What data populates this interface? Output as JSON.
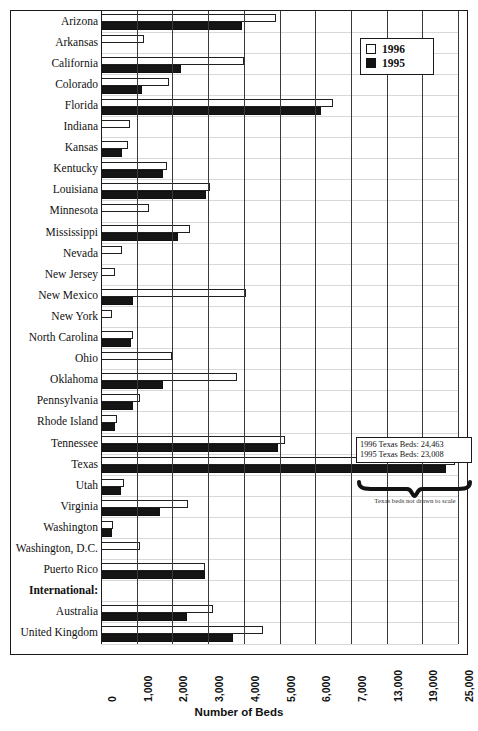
{
  "chart_data": {
    "type": "bar",
    "orientation": "horizontal",
    "title": "",
    "xlabel": "Number of Beds",
    "ylabel": "",
    "grid": true,
    "legend_position": "top-right",
    "axis_break_note": "Axis is broken after 7,000; remaining ticks are 13,000 / 19,000 / 25,000",
    "xticks": [
      "0",
      "1,000",
      "2,000",
      "3,000",
      "4,000",
      "5,000",
      "6,000",
      "7,000",
      "13,000",
      "19,000",
      "25,000"
    ],
    "xtick_values": [
      0,
      1000,
      2000,
      3000,
      4000,
      5000,
      6000,
      7000,
      13000,
      19000,
      25000
    ],
    "categories": [
      "Arizona",
      "Arkansas",
      "California",
      "Colorado",
      "Florida",
      "Indiana",
      "Kansas",
      "Kentucky",
      "Louisiana",
      "Minnesota",
      "Mississippi",
      "Nevada",
      "New Jersey",
      "New Mexico",
      "New York",
      "North Carolina",
      "Ohio",
      "Oklahoma",
      "Pennsylvania",
      "Rhode Island",
      "Tennessee",
      "Texas",
      "Utah",
      "Virginia",
      "Washington",
      "Washington, D.C.",
      "Puerto Rico",
      "International:",
      "Australia",
      "United Kingdom"
    ],
    "series": [
      {
        "name": "1996",
        "color": "#ffffff",
        "values": [
          4900,
          1200,
          4000,
          1900,
          6500,
          800,
          750,
          1850,
          3050,
          1350,
          2500,
          600,
          400,
          4050,
          300,
          900,
          2000,
          3800,
          1100,
          450,
          5150,
          24463,
          650,
          2450,
          350,
          1100,
          2900,
          null,
          3150,
          4550
        ]
      },
      {
        "name": "1995",
        "color": "#151515",
        "values": [
          3950,
          null,
          2250,
          1150,
          6150,
          null,
          600,
          1750,
          2950,
          null,
          2150,
          null,
          null,
          900,
          null,
          850,
          null,
          1750,
          900,
          400,
          4950,
          23008,
          550,
          1650,
          300,
          null,
          2900,
          null,
          2400,
          3700
        ]
      }
    ],
    "annotations": {
      "texas_box_line1": "1996 Texas Beds: 24,463",
      "texas_box_line2": "1995 Texas Beds: 23,008",
      "texas_note": "Texas beds not drawn to scale"
    }
  },
  "legend": {
    "items": [
      {
        "label": "1996",
        "style": "open"
      },
      {
        "label": "1995",
        "style": "filled"
      }
    ]
  },
  "axis": {
    "title": "Number of Beds"
  },
  "footnote": {
    "text": ""
  }
}
